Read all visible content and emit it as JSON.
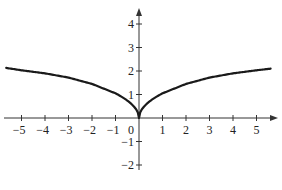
{
  "chart_data": {
    "type": "line",
    "title": "",
    "xlabel": "",
    "ylabel": "",
    "xlim": [
      -5.7,
      5.8
    ],
    "ylim": [
      -2.1,
      4.5
    ],
    "grid": false,
    "legend": null,
    "x_ticks": [
      -5,
      -4,
      -3,
      -2,
      -1,
      0,
      1,
      2,
      3,
      4,
      5
    ],
    "x_tick_labels": [
      "−5",
      "−4",
      "−3",
      "−2",
      "−1",
      "0",
      "1",
      "2",
      "3",
      "4",
      "5"
    ],
    "y_ticks": [
      -2,
      -1,
      1,
      2,
      3,
      4
    ],
    "y_tick_labels": [
      "−2",
      "−1",
      "1",
      "2",
      "3",
      "4"
    ],
    "series": [
      {
        "name": "curve",
        "description": "even function with a cusp at the origin, increasing with |x|",
        "x": [
          -5.65,
          -5,
          -4,
          -3,
          -2,
          -1,
          -0.5,
          -0.1,
          0,
          0.1,
          0.5,
          1,
          2,
          3,
          4,
          5,
          5.6
        ],
        "y": [
          2.13,
          2.03,
          1.9,
          1.72,
          1.45,
          1.05,
          0.72,
          0.32,
          0,
          0.32,
          0.72,
          1.05,
          1.45,
          1.72,
          1.9,
          2.03,
          2.1
        ]
      }
    ]
  }
}
